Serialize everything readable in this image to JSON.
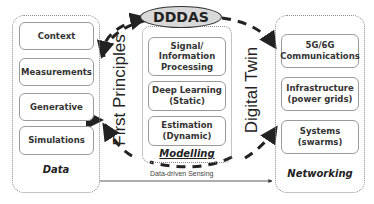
{
  "left_panel": {
    "label": "Data",
    "items": [
      "Context",
      "Measurements",
      "Generative",
      "Simulations"
    ]
  },
  "center_panel": {
    "title": "DDDAS",
    "label": "Modelling",
    "items": [
      "Signal/\nInformation\nProcessing",
      "Deep Learning\n(Static)",
      "Estimation\n(Dynamic)"
    ]
  },
  "right_panel": {
    "label": "Networking",
    "items": [
      "5G/6G\nCommunications",
      "Infrastructure\n(power grids)",
      "Systems\n(swarms)"
    ]
  },
  "loop_labels": {
    "left": "First Principles",
    "right": "Digital Twin"
  },
  "arrow_label": "Data-driven Sensing",
  "colors": {
    "ellipse_fill": "#d9d9d9",
    "stroke": "#222222",
    "box_border": "#9a9a9a"
  }
}
